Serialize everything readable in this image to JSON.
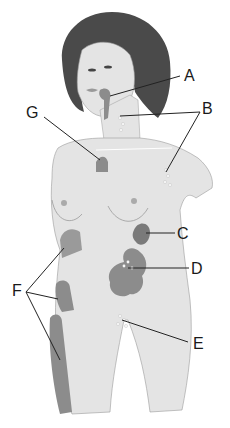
{
  "diagram": {
    "labels": [
      {
        "id": "A",
        "text": "A",
        "x": 184,
        "y": 68
      },
      {
        "id": "B",
        "text": "B",
        "x": 202,
        "y": 101
      },
      {
        "id": "G",
        "text": "G",
        "x": 26,
        "y": 105
      },
      {
        "id": "C",
        "text": "C",
        "x": 177,
        "y": 226
      },
      {
        "id": "D",
        "text": "D",
        "x": 191,
        "y": 261
      },
      {
        "id": "E",
        "text": "E",
        "x": 193,
        "y": 336
      },
      {
        "id": "F",
        "text": "F",
        "x": 12,
        "y": 283
      }
    ],
    "colors": {
      "skin": "#e4e4e4",
      "outline": "#9a9a9a",
      "hair": "#4a4a4a",
      "organ": "#8c8c8c",
      "organ_dark": "#7a7a7a",
      "node": "#f6f6f6",
      "leader": "#222222"
    }
  }
}
